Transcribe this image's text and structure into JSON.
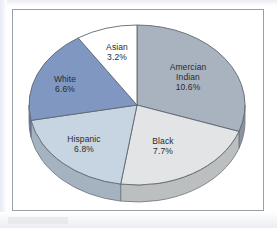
{
  "chart_data": {
    "type": "pie",
    "title": "",
    "subtitle": "",
    "xlabel": "",
    "ylabel": "",
    "legend": "none",
    "grid": false,
    "style": "3d-pie",
    "rotation_note": "first slice begins at 12 o'clock, slices proceed clockwise",
    "value_unit": "percent",
    "total_of_values": 34.9,
    "categories": [
      "Amercian Indian",
      "Black",
      "Hispanic",
      "White",
      "Asian"
    ],
    "values": [
      10.6,
      7.7,
      6.8,
      6.6,
      3.2
    ],
    "value_labels": [
      "10.6%",
      "7.7%",
      "6.8%",
      "6.6%",
      "3.2%"
    ],
    "colors": [
      "#a9b2bf",
      "#e2e4e5",
      "#c7d5e3",
      "#7f97c1",
      "#ffffff"
    ],
    "side_colors": [
      "#8a939f",
      "#bcbfc0",
      "#a5b2bf",
      "#63789c",
      "#d4d7da"
    ],
    "slices": [
      {
        "label": "Amercian Indian",
        "label_line1": "Amercian",
        "label_line2": "Indian",
        "value": 10.6,
        "value_label": "10.6%",
        "color": "#a9b2bf",
        "side_color": "#8a939f",
        "start_angle_deg": 0,
        "end_angle_deg": 109.3
      },
      {
        "label": "Black",
        "label_line1": "Black",
        "label_line2": "",
        "value": 7.7,
        "value_label": "7.7%",
        "color": "#e2e4e5",
        "side_color": "#bcbfc0",
        "start_angle_deg": 109.3,
        "end_angle_deg": 188.7
      },
      {
        "label": "Hispanic",
        "label_line1": "Hispanic",
        "label_line2": "",
        "value": 6.8,
        "value_label": "6.8%",
        "color": "#c7d5e3",
        "side_color": "#a5b2bf",
        "start_angle_deg": 188.7,
        "end_angle_deg": 258.9
      },
      {
        "label": "White",
        "label_line1": "White",
        "label_line2": "",
        "value": 6.6,
        "value_label": "6.6%",
        "color": "#7f97c1",
        "side_color": "#63789c",
        "start_angle_deg": 258.9,
        "end_angle_deg": 327.0
      },
      {
        "label": "Asian",
        "label_line1": "Asian",
        "label_line2": "",
        "value": 3.2,
        "value_label": "3.2%",
        "color": "#ffffff",
        "side_color": "#d4d7da",
        "start_angle_deg": 327.0,
        "end_angle_deg": 360.0
      }
    ]
  },
  "frame": {
    "border_color": "#9aa0a8",
    "background": "#ffffff"
  }
}
